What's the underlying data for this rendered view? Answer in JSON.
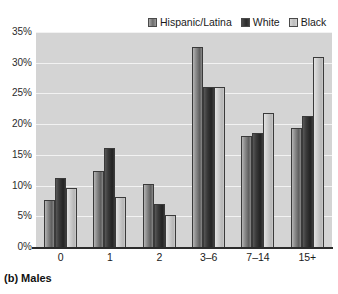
{
  "caption": "(b) Males",
  "legend": {
    "position": "top-right",
    "entries": [
      {
        "label": "Hispanic/Latina",
        "color": "#6d6d6d",
        "swatch": "legend-swatch-hispanic-latina"
      },
      {
        "label": "White",
        "color": "#2b2b2b",
        "swatch": "legend-swatch-white"
      },
      {
        "label": "Black",
        "color": "#bdbdbd",
        "swatch": "legend-swatch-black"
      }
    ]
  },
  "chart_data": {
    "type": "bar",
    "title": "(b) Males",
    "xlabel": "",
    "ylabel": "",
    "categories": [
      "0",
      "1",
      "2",
      "3–6",
      "7–14",
      "15+"
    ],
    "series": [
      {
        "name": "Hispanic/Latina",
        "color": "#6d6d6d",
        "values": [
          7.6,
          12.3,
          10.3,
          32.5,
          18.0,
          19.3
        ]
      },
      {
        "name": "White",
        "color": "#2b2b2b",
        "values": [
          11.3,
          16.1,
          7.0,
          26.0,
          18.5,
          21.3
        ]
      },
      {
        "name": "Black",
        "color": "#bdbdbd",
        "values": [
          9.6,
          8.1,
          5.2,
          26.0,
          21.8,
          31.0
        ]
      }
    ],
    "ylim": [
      0,
      35
    ],
    "yticks": [
      0,
      5,
      10,
      15,
      20,
      25,
      30,
      35
    ],
    "ytick_labels": [
      "0%",
      "5%",
      "10%",
      "15%",
      "20%",
      "25%",
      "30%",
      "35%"
    ],
    "grid": true,
    "legend_position": "top-right",
    "plot_background": "#d4d4d4",
    "gridline_color": "#f2f2f2"
  }
}
